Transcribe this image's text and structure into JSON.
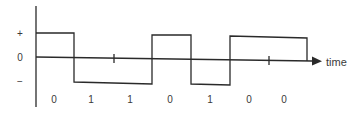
{
  "diagram": {
    "type": "bipolar NRZ waveform",
    "y_labels": [
      {
        "text": "+",
        "x": 20,
        "y": 33
      },
      {
        "text": "0",
        "x": 20,
        "y": 57
      },
      {
        "text": "−",
        "x": 20,
        "y": 81
      }
    ],
    "axis_label": "time",
    "bits": [
      "0",
      "1",
      "1",
      "0",
      "1",
      "0",
      "0"
    ],
    "bit_label_x": [
      54,
      91,
      130,
      170,
      210,
      249,
      284
    ],
    "bit_label_y": 99,
    "colors": {
      "line": "#2a2a2a",
      "text": "#3a3a3a"
    }
  }
}
